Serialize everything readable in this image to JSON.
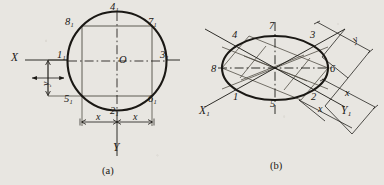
{
  "figure": {
    "title_a": "(a)",
    "title_b": "(b)",
    "stroke_color": "#1a1814",
    "background_color": "#e8e6e1"
  },
  "panel_a": {
    "caption": "(a)",
    "shape": "circle",
    "axes": {
      "x_label": "X",
      "y_label": "Y"
    },
    "points": [
      {
        "id": "1",
        "label": "1",
        "sub": "1",
        "pos": "left"
      },
      {
        "id": "2",
        "label": "2",
        "sub": "1",
        "pos": "bottom"
      },
      {
        "id": "3",
        "label": "3",
        "sub": "1",
        "pos": "right"
      },
      {
        "id": "4",
        "label": "4",
        "sub": "1",
        "pos": "top"
      },
      {
        "id": "5",
        "label": "5",
        "sub": "1",
        "pos": "bottom-left"
      },
      {
        "id": "6",
        "label": "6",
        "sub": "1",
        "pos": "bottom-right"
      },
      {
        "id": "7",
        "label": "7",
        "sub": "1",
        "pos": "top-right"
      },
      {
        "id": "8",
        "label": "8",
        "sub": "1",
        "pos": "top-left"
      }
    ],
    "center_label": "O",
    "dimensions": [
      {
        "name": "y-dimension",
        "label": "y",
        "orientation": "vertical"
      },
      {
        "name": "x-dimension-left",
        "label": "x",
        "orientation": "horizontal"
      },
      {
        "name": "x-dimension-right",
        "label": "x",
        "orientation": "horizontal"
      }
    ]
  },
  "panel_b": {
    "caption": "(b)",
    "shape": "ellipse",
    "axes": {
      "x_label": "X",
      "x_sub": "1",
      "y_label": "Y",
      "y_sub": "1"
    },
    "points": [
      {
        "id": "1",
        "label": "1",
        "pos": "lower-left"
      },
      {
        "id": "2",
        "label": "2",
        "pos": "lower-right"
      },
      {
        "id": "3",
        "label": "3",
        "pos": "upper-right"
      },
      {
        "id": "4",
        "label": "4",
        "pos": "upper-left"
      },
      {
        "id": "5",
        "label": "5",
        "pos": "bottom"
      },
      {
        "id": "6",
        "label": "6",
        "pos": "right"
      },
      {
        "id": "7",
        "label": "7",
        "pos": "top"
      },
      {
        "id": "8",
        "label": "8",
        "pos": "left"
      }
    ],
    "dimensions": [
      {
        "name": "y-dimension",
        "label": "y",
        "orientation": "oblique-up"
      },
      {
        "name": "x-dimension-upper",
        "label": "x",
        "orientation": "oblique-down"
      },
      {
        "name": "x-dimension-lower",
        "label": "x",
        "orientation": "oblique-down"
      }
    ]
  }
}
